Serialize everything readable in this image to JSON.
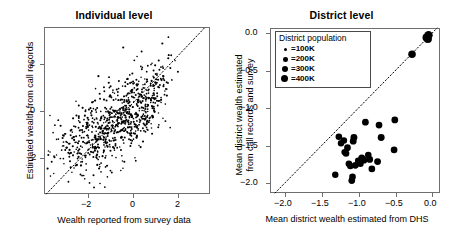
{
  "figure": {
    "panels": [
      {
        "id": "individual",
        "title": "Individual level",
        "xlabel": "Wealth reported from survey data",
        "ylabel": "Estimated wealth from call records",
        "xticks": [
          "−2",
          "0",
          "2"
        ],
        "yticks": [
          "2",
          "0",
          "−2"
        ]
      },
      {
        "id": "district",
        "title": "District level",
        "xlabel": "Mean district wealth estimated from DHS",
        "ylabel_line1": "Mean district wealth estimated",
        "ylabel_line2": "from call records and survey",
        "xticks": [
          "−2.0",
          "−1.5",
          "−1.0",
          "−0.5",
          "0.0"
        ],
        "yticks": [
          "0.0",
          "−0.5",
          "−1.0",
          "−1.5",
          "−2.0"
        ],
        "legend": {
          "title": "District population",
          "items": [
            {
              "label": "=100K",
              "size": 2.6
            },
            {
              "label": "=200K",
              "size": 4.0
            },
            {
              "label": "=300K",
              "size": 5.2
            },
            {
              "label": "=400K",
              "size": 6.4
            }
          ]
        }
      }
    ]
  },
  "chart_data": [
    {
      "type": "scatter",
      "title": "Individual level",
      "xlabel": "Wealth reported from survey data",
      "ylabel": "Estimated wealth from call records",
      "xlim": [
        -3.7,
        3.5
      ],
      "ylim": [
        -3.6,
        3.3
      ],
      "xticks": [
        -2,
        0,
        2
      ],
      "yticks": [
        2,
        0,
        -2
      ],
      "grid": false,
      "legend": "none",
      "annotations": [
        "dotted 1:1 identity line"
      ],
      "marker": {
        "shape": "circle",
        "color": "#000000",
        "size_px": 1.6
      },
      "n_points": 856,
      "description": "Dense positively-correlated cloud of individual observations; survey wealth vs call-record estimated wealth, correlation approx 0.68",
      "points_summary": {
        "x_mean": -0.55,
        "y_mean": -0.55,
        "x_sd": 1.25,
        "y_sd": 1.05,
        "correlation": 0.68
      }
    },
    {
      "type": "scatter",
      "title": "District level",
      "xlabel": "Mean district wealth estimated from DHS",
      "ylabel": "Mean district wealth estimated from call records and survey",
      "xlim": [
        -2.25,
        0.12
      ],
      "ylim": [
        -2.18,
        0.08
      ],
      "xticks": [
        -2.0,
        -1.5,
        -1.0,
        -0.5,
        0.0
      ],
      "yticks": [
        0.0,
        -0.5,
        -1.0,
        -1.5,
        -2.0
      ],
      "grid": false,
      "legend": "upper left",
      "size_legend": {
        "title": "District population",
        "labels": [
          "=100K",
          "=200K",
          "=300K",
          "=400K"
        ],
        "values": [
          100000,
          200000,
          300000,
          400000
        ]
      },
      "annotations": [
        "dotted 1:1 identity line"
      ],
      "marker": {
        "shape": "circle",
        "color": "#000000"
      },
      "points": [
        {
          "x": -0.04,
          "y": -0.02,
          "pop": 430000
        },
        {
          "x": -0.05,
          "y": -0.07,
          "pop": 400000
        },
        {
          "x": -0.07,
          "y": -0.05,
          "pop": 330000
        },
        {
          "x": -0.27,
          "y": -0.28,
          "pop": 300000
        },
        {
          "x": -0.51,
          "y": -1.18,
          "pop": 200000
        },
        {
          "x": -0.52,
          "y": -1.59,
          "pop": 190000
        },
        {
          "x": -0.7,
          "y": -1.42,
          "pop": 220000
        },
        {
          "x": -0.73,
          "y": -1.25,
          "pop": 200000
        },
        {
          "x": -0.75,
          "y": -1.75,
          "pop": 210000
        },
        {
          "x": -0.83,
          "y": -1.85,
          "pop": 190000
        },
        {
          "x": -0.86,
          "y": -1.72,
          "pop": 200000
        },
        {
          "x": -0.88,
          "y": -1.66,
          "pop": 180000
        },
        {
          "x": -0.92,
          "y": -1.21,
          "pop": 200000
        },
        {
          "x": -0.94,
          "y": -1.73,
          "pop": 210000
        },
        {
          "x": -0.97,
          "y": -1.7,
          "pop": 230000
        },
        {
          "x": -0.99,
          "y": -1.78,
          "pop": 190000
        },
        {
          "x": -1.02,
          "y": -1.74,
          "pop": 180000
        },
        {
          "x": -1.06,
          "y": -1.8,
          "pop": 200000
        },
        {
          "x": -1.08,
          "y": -1.42,
          "pop": 220000
        },
        {
          "x": -1.09,
          "y": -1.47,
          "pop": 210000
        },
        {
          "x": -1.1,
          "y": -1.96,
          "pop": 190000
        },
        {
          "x": -1.11,
          "y": -2.01,
          "pop": 200000
        },
        {
          "x": -1.13,
          "y": -1.81,
          "pop": 180000
        },
        {
          "x": -1.15,
          "y": -1.78,
          "pop": 190000
        },
        {
          "x": -1.17,
          "y": -1.56,
          "pop": 200000
        },
        {
          "x": -1.19,
          "y": -1.64,
          "pop": 180000
        },
        {
          "x": -1.21,
          "y": -1.62,
          "pop": 170000
        },
        {
          "x": -1.22,
          "y": -1.46,
          "pop": 180000
        },
        {
          "x": -1.26,
          "y": -1.5,
          "pop": 170000
        },
        {
          "x": -1.29,
          "y": -1.41,
          "pop": 190000
        },
        {
          "x": -1.34,
          "y": -1.93,
          "pop": 170000
        }
      ],
      "description": "District-level means; points fall below the 1:1 line indicating call-record estimates are lower than DHS estimates for poorer districts"
    }
  ]
}
